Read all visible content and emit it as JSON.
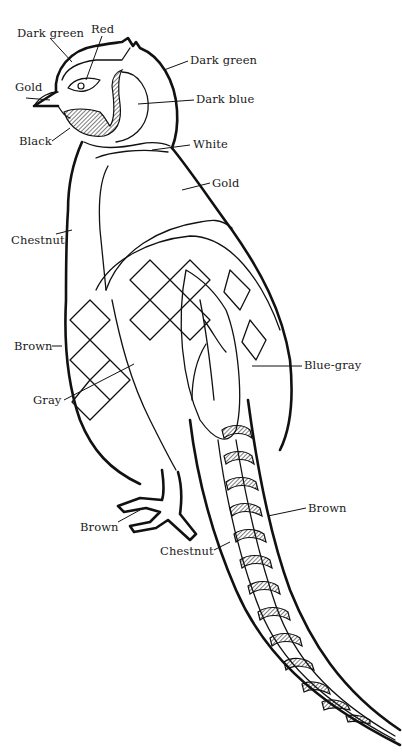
{
  "diagram": {
    "labels": [
      {
        "id": "dark-green-crown",
        "text": "Dark green",
        "x": 17,
        "y": 28
      },
      {
        "id": "red-eye",
        "text": "Red",
        "x": 91,
        "y": 24
      },
      {
        "id": "dark-green-neck",
        "text": "Dark green",
        "x": 190,
        "y": 55
      },
      {
        "id": "gold-beak",
        "text": "Gold",
        "x": 15,
        "y": 82
      },
      {
        "id": "dark-blue",
        "text": "Dark blue",
        "x": 196,
        "y": 94
      },
      {
        "id": "black",
        "text": "Black",
        "x": 19,
        "y": 136
      },
      {
        "id": "white",
        "text": "White",
        "x": 193,
        "y": 139
      },
      {
        "id": "gold-back",
        "text": "Gold",
        "x": 212,
        "y": 178
      },
      {
        "id": "chestnut-breast",
        "text": "Chestnut",
        "x": 11,
        "y": 235
      },
      {
        "id": "brown-wing",
        "text": "Brown",
        "x": 14,
        "y": 341
      },
      {
        "id": "blue-gray",
        "text": "Blue-gray",
        "x": 304,
        "y": 360
      },
      {
        "id": "gray",
        "text": "Gray",
        "x": 33,
        "y": 395
      },
      {
        "id": "brown-tail",
        "text": "Brown",
        "x": 308,
        "y": 503
      },
      {
        "id": "brown-feet",
        "text": "Brown",
        "x": 80,
        "y": 522
      },
      {
        "id": "chestnut-tail",
        "text": "Chestnut",
        "x": 160,
        "y": 546
      }
    ]
  }
}
